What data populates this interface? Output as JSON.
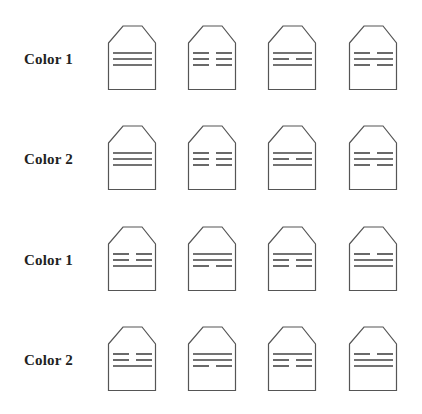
{
  "style": {
    "stroke_color": "#555555",
    "line_color": "#444444",
    "label_color": "#222222",
    "background": "#ffffff"
  },
  "rows": [
    {
      "label": "Color 1",
      "icons": [
        {
          "pattern": [
            "full",
            "full",
            "full"
          ]
        },
        {
          "pattern": [
            "split",
            "split",
            "split"
          ]
        },
        {
          "pattern": [
            "full",
            "split",
            "full"
          ]
        },
        {
          "pattern": [
            "split",
            "full",
            "split"
          ]
        }
      ]
    },
    {
      "label": "Color 2",
      "icons": [
        {
          "pattern": [
            "full",
            "full",
            "full"
          ]
        },
        {
          "pattern": [
            "split",
            "split",
            "split"
          ]
        },
        {
          "pattern": [
            "full",
            "split",
            "full"
          ]
        },
        {
          "pattern": [
            "split",
            "full",
            "split"
          ]
        }
      ]
    },
    {
      "label": "Color 1",
      "icons": [
        {
          "pattern": [
            "split",
            "split",
            "full"
          ]
        },
        {
          "pattern": [
            "full",
            "full",
            "split"
          ]
        },
        {
          "pattern": [
            "full",
            "split",
            "split"
          ]
        },
        {
          "pattern": [
            "split",
            "full",
            "full"
          ]
        }
      ]
    },
    {
      "label": "Color 2",
      "icons": [
        {
          "pattern": [
            "split",
            "split",
            "full"
          ]
        },
        {
          "pattern": [
            "full",
            "full",
            "split"
          ]
        },
        {
          "pattern": [
            "full",
            "split",
            "split"
          ]
        },
        {
          "pattern": [
            "split",
            "full",
            "full"
          ]
        }
      ]
    }
  ]
}
